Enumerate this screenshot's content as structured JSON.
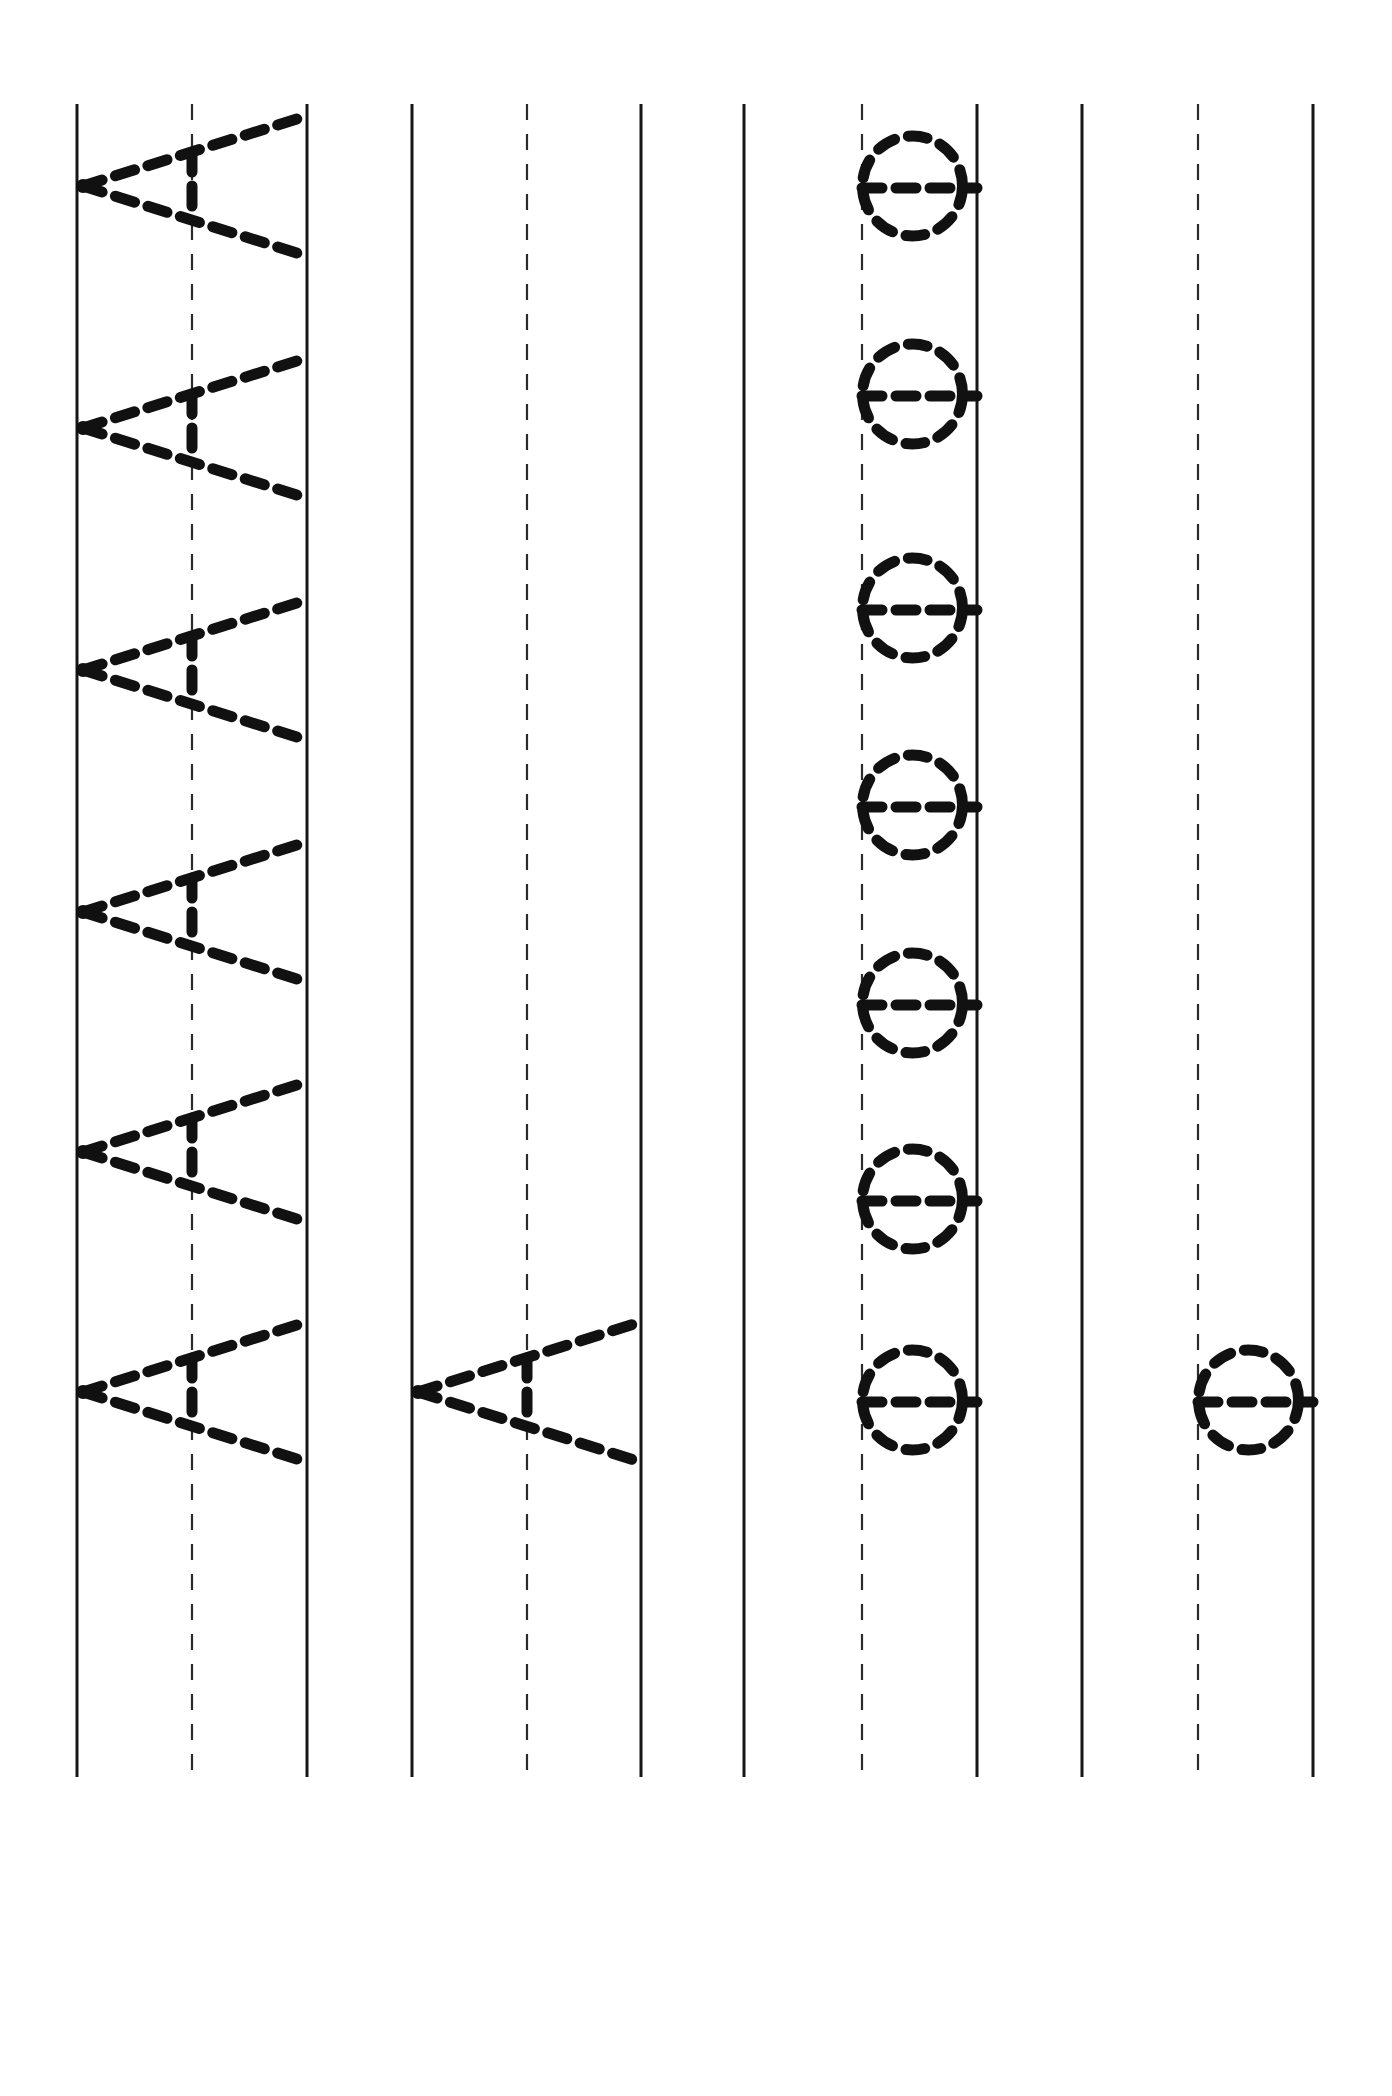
{
  "document": {
    "type": "handwriting-tracing-worksheet",
    "orientation": "rotated-90-clockwise",
    "page_width": 1392,
    "page_height": 2096,
    "background_color": "#ffffff",
    "ink_color": "#111111",
    "rule_color": "#161616",
    "dashed_rule_color": "#2b2b2b"
  },
  "rules": {
    "line_top_y": 104,
    "line_bottom_y": 1777,
    "description": "Each writing band is bounded by two solid guide rules with a dashed midline between them. The sheet is rotated 90 degrees so the rules run vertically.",
    "bands": [
      {
        "name": "band-1",
        "top_rule_x": 77,
        "mid_dashed_x": 192,
        "base_rule_x": 307,
        "letter": "A",
        "letter_count": 6
      },
      {
        "name": "band-2",
        "top_rule_x": 412,
        "mid_dashed_x": 527,
        "base_rule_x": 641,
        "letter": "A",
        "letter_count": 1
      },
      {
        "name": "band-3",
        "top_rule_x": 744,
        "mid_dashed_x": 862,
        "base_rule_x": 977,
        "letter": "O",
        "letter_count": 7
      },
      {
        "name": "band-4",
        "top_rule_x": 1082,
        "mid_dashed_x": 1198,
        "base_rule_x": 1313,
        "letter": "O",
        "letter_count": 1
      }
    ]
  },
  "letters": {
    "A": {
      "glyph": "A",
      "case": "uppercase",
      "stroke_style": "dashed-trace",
      "has_start_dot": true,
      "description": "Uppercase A drawn as two diagonal strokes meeting at an apex plus a crossbar; rendered rotated so the apex points left toward the top rule."
    },
    "O": {
      "glyph": "O",
      "case": "uppercase",
      "stroke_style": "dashed-trace",
      "has_start_dot": false,
      "description": "Uppercase O drawn as a dashed circle sitting against the baseline rule."
    }
  },
  "traced_glyphs": [
    {
      "band": "band-1",
      "letter": "A",
      "index": 1,
      "center_y": 186
    },
    {
      "band": "band-1",
      "letter": "A",
      "index": 2,
      "center_y": 428
    },
    {
      "band": "band-1",
      "letter": "A",
      "index": 3,
      "center_y": 670
    },
    {
      "band": "band-1",
      "letter": "A",
      "index": 4,
      "center_y": 912
    },
    {
      "band": "band-1",
      "letter": "A",
      "index": 5,
      "center_y": 1152
    },
    {
      "band": "band-1",
      "letter": "A",
      "index": 6,
      "center_y": 1392
    },
    {
      "band": "band-2",
      "letter": "A",
      "index": 1,
      "center_y": 1392
    },
    {
      "band": "band-3",
      "letter": "O",
      "index": 1,
      "center_y": 186
    },
    {
      "band": "band-3",
      "letter": "O",
      "index": 2,
      "center_y": 394
    },
    {
      "band": "band-3",
      "letter": "O",
      "index": 3,
      "center_y": 608
    },
    {
      "band": "band-3",
      "letter": "O",
      "index": 4,
      "center_y": 805
    },
    {
      "band": "band-3",
      "letter": "O",
      "index": 5,
      "center_y": 1003
    },
    {
      "band": "band-3",
      "letter": "O",
      "index": 6,
      "center_y": 1199
    },
    {
      "band": "band-3",
      "letter": "O",
      "index": 7,
      "center_y": 1400
    },
    {
      "band": "band-4",
      "letter": "O",
      "index": 1,
      "center_y": 1400
    }
  ]
}
